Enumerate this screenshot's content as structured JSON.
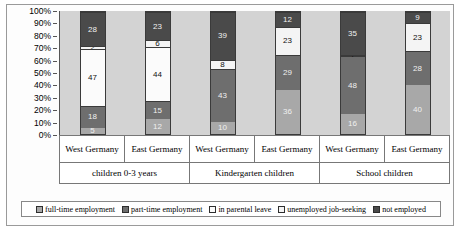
{
  "chart_data": {
    "type": "bar",
    "subtype": "stacked-100-percent",
    "title": "",
    "xlabel": "",
    "ylabel": "",
    "ylim": [
      0,
      100
    ],
    "ytick_labels": [
      "100%",
      "90%",
      "80%",
      "70%",
      "60%",
      "50%",
      "40%",
      "30%",
      "20%",
      "10%",
      "0%"
    ],
    "grid": false,
    "legend_position": "bottom",
    "categories": [
      "West Germany",
      "East Germany",
      "West Germany",
      "East Germany",
      "West Germany",
      "East Germany"
    ],
    "group_labels": [
      "children 0-3 years",
      "Kindergarten children",
      "School children"
    ],
    "group_spans": [
      2,
      2,
      2
    ],
    "series": [
      {
        "name": "full-time employment",
        "color": "#a8a8a8",
        "values": [
          5,
          12,
          10,
          36,
          16,
          40
        ]
      },
      {
        "name": "part-time employment",
        "color": "#6e6e6e",
        "values": [
          18,
          15,
          43,
          29,
          48,
          28
        ]
      },
      {
        "name": "in parental leave",
        "color": "#fbfbfb",
        "values": [
          47,
          44,
          0,
          0,
          0,
          0
        ]
      },
      {
        "name": "unemployed job-seeking",
        "color": "#f4f4f4",
        "values": [
          2,
          6,
          8,
          23,
          1,
          23
        ]
      },
      {
        "name": "not employed",
        "color": "#4a4a4a",
        "values": [
          28,
          23,
          39,
          12,
          35,
          9
        ]
      }
    ]
  },
  "legend": {
    "items": [
      {
        "label": "full-time employment",
        "color": "#a8a8a8"
      },
      {
        "label": "part-time employment",
        "color": "#6e6e6e"
      },
      {
        "label": "in parental leave",
        "color": "#fbfbfb"
      },
      {
        "label": "unemployed job-seeking",
        "color": "#f4f4f4"
      },
      {
        "label": "not employed",
        "color": "#4a4a4a"
      }
    ]
  }
}
